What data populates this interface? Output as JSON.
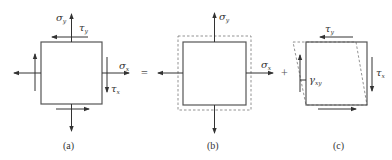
{
  "figure": {
    "panels": [
      {
        "id": "a",
        "caption": "(a)",
        "labels": {
          "sigma_y": {
            "sym": "σ",
            "sub": "y"
          },
          "tau_y": {
            "sym": "τ",
            "sub": "y"
          },
          "sigma_x": {
            "sym": "σ",
            "sub": "x"
          },
          "tau_x": {
            "sym": "τ",
            "sub": "x"
          }
        }
      },
      {
        "id": "b",
        "caption": "(b)",
        "labels": {
          "sigma_y": {
            "sym": "σ",
            "sub": "y"
          },
          "sigma_x": {
            "sym": "σ",
            "sub": "x"
          }
        }
      },
      {
        "id": "c",
        "caption": "(c)",
        "labels": {
          "tau_y": {
            "sym": "τ",
            "sub": "y"
          },
          "tau_x": {
            "sym": "τ",
            "sub": "x"
          },
          "gamma_xy": {
            "sym": "γ",
            "sub": "xy"
          }
        }
      }
    ],
    "operators": {
      "equals": "=",
      "plus": "+"
    },
    "colors": {
      "stroke": "#333333",
      "box": "#555555",
      "dashed": "#777777"
    }
  }
}
